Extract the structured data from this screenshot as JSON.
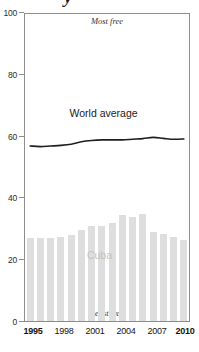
{
  "chart_data": {
    "type": "bar",
    "title": "",
    "xlabel": "",
    "ylabel": "",
    "ylim": [
      0,
      100
    ],
    "ytick_values": [
      0,
      20,
      40,
      60,
      80,
      100
    ],
    "ytick_labels": [
      "0",
      "20",
      "40",
      "60",
      "80",
      "100"
    ],
    "grid": false,
    "legend": "in-plot labels",
    "x": [
      1995,
      1996,
      1997,
      1998,
      1999,
      2000,
      2001,
      2002,
      2003,
      2004,
      2005,
      2006,
      2007,
      2008,
      2009,
      2010
    ],
    "categories": [
      "1995",
      "1996",
      "1997",
      "1998",
      "1999",
      "2000",
      "2001",
      "2002",
      "2003",
      "2004",
      "2005",
      "2006",
      "2007",
      "2008",
      "2009",
      "2010"
    ],
    "xtick_labels": [
      "1995",
      "1998",
      "2001",
      "2004",
      "2007",
      "2010"
    ],
    "xtick_values": [
      1995,
      1998,
      2001,
      2004,
      2007,
      2010
    ],
    "series": [
      {
        "name": "Cuba",
        "type": "bar",
        "color": "#dedede",
        "values": [
          27,
          27,
          27,
          27.5,
          28,
          29.5,
          31,
          31,
          32,
          34.5,
          34,
          35,
          29,
          28.5,
          27.5,
          26.5
        ]
      },
      {
        "name": "World average",
        "type": "line",
        "color": "#1f1f1f",
        "values": [
          57,
          56.8,
          57,
          57.2,
          57.6,
          58.4,
          58.8,
          59,
          59,
          59,
          59.2,
          59.4,
          59.8,
          59.5,
          59.2,
          59.3
        ]
      }
    ],
    "annotations": [
      {
        "text": "Most free",
        "position": "top-center"
      },
      {
        "text": "Least free",
        "position": "bottom-center"
      },
      {
        "text": "World average",
        "position": "line-series-label"
      },
      {
        "text": "Cuba",
        "position": "bar-series-label"
      }
    ]
  },
  "axes": {
    "y_ticks": [
      "100",
      "80",
      "60",
      "40",
      "20",
      "0"
    ],
    "x_ticks": [
      {
        "label": "1995",
        "bold": true
      },
      {
        "label": "1998",
        "bold": false
      },
      {
        "label": "2001",
        "bold": false
      },
      {
        "label": "2004",
        "bold": false
      },
      {
        "label": "2007",
        "bold": false
      },
      {
        "label": "2010",
        "bold": true
      }
    ]
  },
  "labels": {
    "most_free": "Most free",
    "least_free": "Least free",
    "world_average": "World average",
    "cuba": "Cuba"
  },
  "title_fragment": "y",
  "colors": {
    "bar": "#dedede",
    "line": "#1f1f1f",
    "frame": "#8d8d8d",
    "cuba_label": "#c2c2c2",
    "tick_text": "#141414"
  }
}
